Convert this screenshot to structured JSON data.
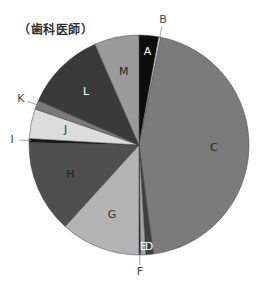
{
  "chart_data": {
    "type": "pie",
    "title": "（歯科医師）",
    "start_angle_deg": 0,
    "direction": "clockwise",
    "categories": [
      "A",
      "B",
      "C",
      "D",
      "E",
      "F",
      "G",
      "H",
      "I",
      "J",
      "K",
      "L",
      "M"
    ],
    "values": [
      2.9,
      0.3,
      45.0,
      1.1,
      0.8,
      0.2,
      11.8,
      13.7,
      0.6,
      4.4,
      1.3,
      11.9,
      6.6
    ],
    "colors": [
      "#0d0d0d",
      "#e0e0e0",
      "#7b7b7b",
      "#3f3f3f",
      "#a5a5a5",
      "#101010",
      "#b3b3b3",
      "#4f4f4f",
      "#151515",
      "#dcdcdc",
      "#7a7a7a",
      "#3a3a3a",
      "#9a9a9a"
    ],
    "label_colors": [
      "#ffffff",
      "#333333",
      "#222222",
      "#ffffff",
      "#ffffff",
      "#333333",
      "#333333",
      "#222222",
      "#333333",
      "#333333",
      "#333333",
      "#ffffff",
      "#222222"
    ],
    "outside_labels": [
      "B",
      "F",
      "I",
      "K"
    ],
    "legend": "none",
    "units": "%"
  }
}
